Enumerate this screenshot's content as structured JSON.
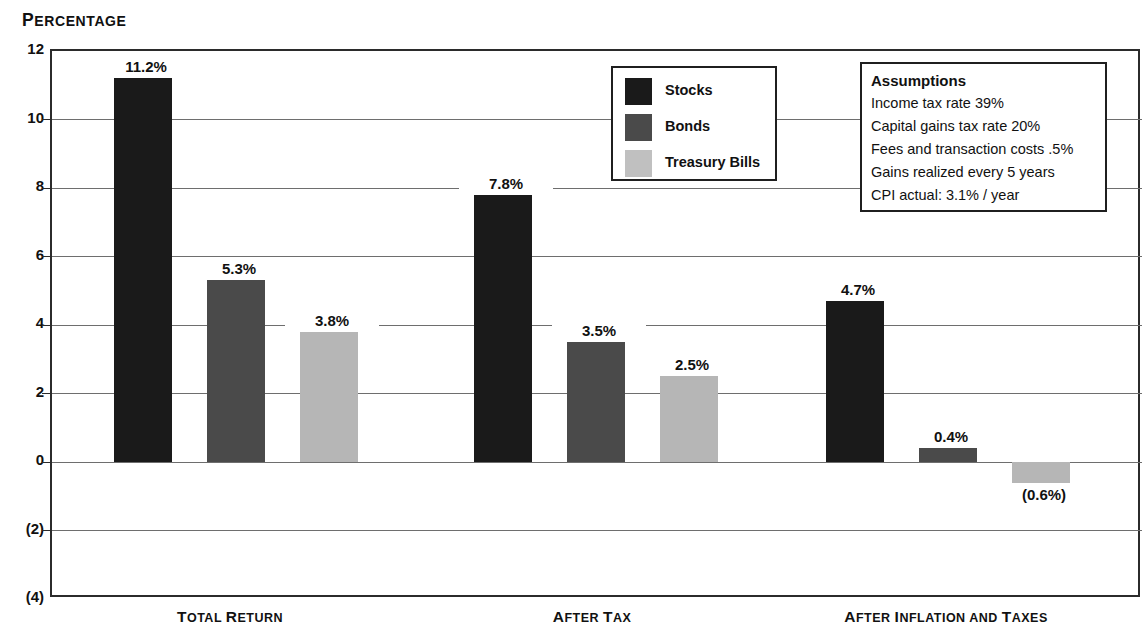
{
  "axis_title": {
    "first": "P",
    "rest": "ERCENTAGE",
    "full": "PERCENTAGE"
  },
  "chart_data": {
    "type": "bar",
    "title": "PERCENTAGE",
    "xlabel": "",
    "ylabel": "Percentage",
    "ylim": [
      -4,
      12
    ],
    "grid": true,
    "legend_position": "inside-top-center",
    "categories": [
      "Total Return",
      "After Tax",
      "After Inflation and Taxes"
    ],
    "ytick_values": [
      12,
      10,
      8,
      6,
      4,
      2,
      0,
      -2,
      -4
    ],
    "ytick_labels": [
      "12",
      "10",
      "8",
      "6",
      "4",
      "2",
      "0",
      "(2)",
      "(4)"
    ],
    "series": [
      {
        "name": "Stocks",
        "color": "#1a1a1a",
        "values": [
          11.2,
          7.8,
          4.7
        ],
        "labels": [
          "11.2%",
          "7.8%",
          "4.7%"
        ]
      },
      {
        "name": "Bonds",
        "color": "#4a4a4a",
        "values": [
          5.3,
          3.5,
          0.4
        ],
        "labels": [
          "5.3%",
          "3.5%",
          "0.4%"
        ]
      },
      {
        "name": "Treasury Bills",
        "color": "#b6b6b6",
        "values": [
          3.8,
          2.5,
          -0.6
        ],
        "labels": [
          "3.8%",
          "2.5%",
          "(0.6%)"
        ]
      }
    ],
    "annotations": {
      "assumptions_title": "Assumptions",
      "assumptions_lines": [
        "Income tax rate 39%",
        "Capital gains tax rate 20%",
        "Fees and transaction costs .5%",
        "Gains realized every 5 years",
        "CPI actual: 3.1% / year"
      ]
    }
  },
  "category_labels": [
    {
      "parts": [
        {
          "t": "T",
          "big": true
        },
        {
          "t": "OTAL ",
          "big": false
        },
        {
          "t": "R",
          "big": true
        },
        {
          "t": "ETURN",
          "big": false
        }
      ]
    },
    {
      "parts": [
        {
          "t": "A",
          "big": true
        },
        {
          "t": "FTER ",
          "big": false
        },
        {
          "t": "T",
          "big": true
        },
        {
          "t": "AX",
          "big": false
        }
      ]
    },
    {
      "parts": [
        {
          "t": "A",
          "big": true
        },
        {
          "t": "FTER ",
          "big": false
        },
        {
          "t": "I",
          "big": true
        },
        {
          "t": "NFLATION AND ",
          "big": false
        },
        {
          "t": "T",
          "big": true
        },
        {
          "t": "AXES",
          "big": false
        }
      ]
    }
  ],
  "legend": {
    "items": [
      {
        "label": "Stocks",
        "swatch": "stocks"
      },
      {
        "label": "Bonds",
        "swatch": "bonds"
      },
      {
        "label": "Treasury Bills",
        "swatch": "tbills"
      }
    ]
  },
  "assumptions": {
    "title": "Assumptions",
    "lines": [
      "Income tax rate 39%",
      "Capital gains tax rate 20%",
      "Fees and transaction costs .5%",
      "Gains realized every 5 years",
      "CPI actual: 3.1% / year"
    ]
  }
}
